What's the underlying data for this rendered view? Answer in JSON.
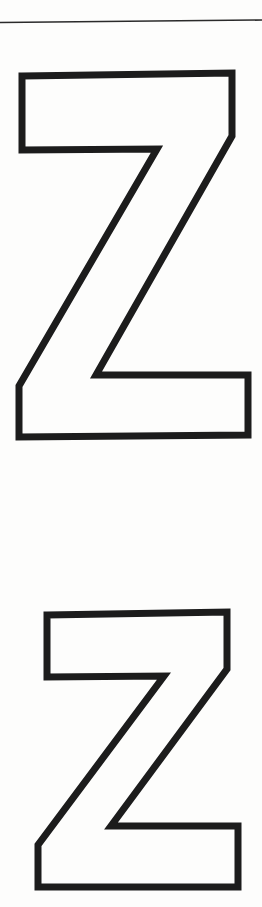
{
  "page": {
    "width": 262,
    "height": 907,
    "background_color": "#fdfdfc",
    "ink_color": "#1c1c1c"
  },
  "rule": {
    "name": "top-horizontal-rule",
    "color": "#2a2a2a",
    "thickness": 1.6,
    "x1": 0,
    "y1": 22.5,
    "x2": 262,
    "y2": 20.0
  },
  "letters": [
    {
      "character": "Z",
      "label": "Large letter Z outline",
      "size": "large",
      "stroke_color": "#1c1c1c",
      "fill_color": "#fdfdfc",
      "stroke_width": 7,
      "bounds": {
        "x": 16,
        "y": 73,
        "width": 234,
        "height": 365
      },
      "points": "22,76 232,73 232,136 96,375 248,375 248,435 19,437 19,386 157,149 22,150"
    },
    {
      "character": "Z",
      "label": "Small letter Z outline",
      "size": "small",
      "stroke_color": "#1c1c1c",
      "fill_color": "#fdfdfc",
      "stroke_width": 7,
      "bounds": {
        "x": 34,
        "y": 612,
        "width": 206,
        "height": 278
      },
      "points": "47,615 227,612 227,669 111,826 238,826 238,887 38,887 38,845 164,676 47,677"
    }
  ]
}
